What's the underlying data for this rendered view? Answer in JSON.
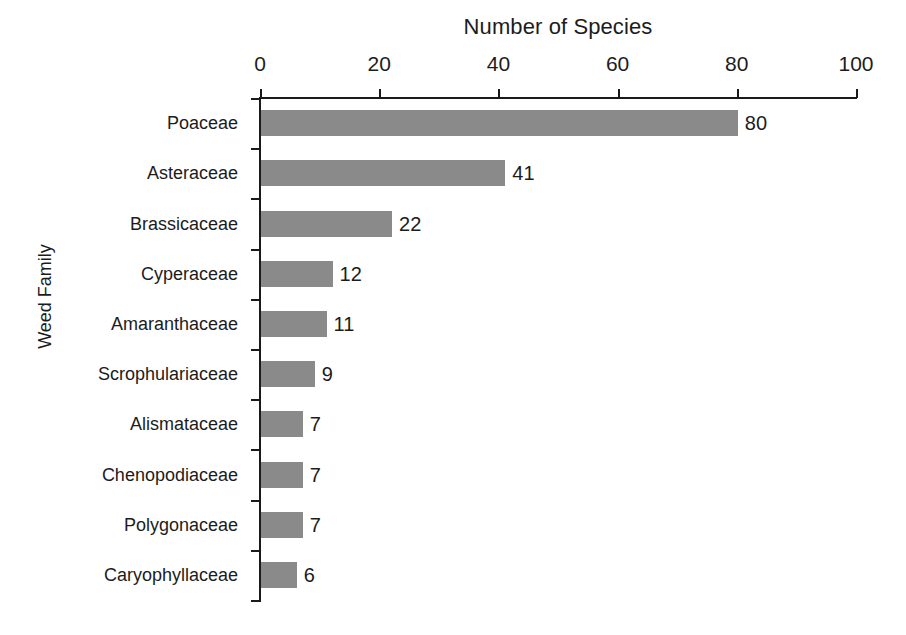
{
  "chart_data": {
    "type": "bar",
    "orientation": "horizontal",
    "title": "Number of Species",
    "xlabel": "Number of Species",
    "ylabel": "Weed Family",
    "xlim": [
      0,
      100
    ],
    "xticks": [
      0,
      20,
      40,
      60,
      80,
      100
    ],
    "grid": false,
    "legend": null,
    "categories": [
      "Poaceae",
      "Asteraceae",
      "Brassicaceae",
      "Cyperaceae",
      "Amaranthaceae",
      "Scrophulariaceae",
      "Alismataceae",
      "Chenopodiaceae",
      "Polygonaceae",
      "Caryophyllaceae"
    ],
    "values": [
      80,
      41,
      22,
      12,
      11,
      9,
      7,
      7,
      7,
      6
    ],
    "data_labels": [
      "80",
      "41",
      "22",
      "12",
      "11",
      "9",
      "7",
      "7",
      "7",
      "6"
    ],
    "bar_color": "#8a8a8a",
    "axis_color": "#1a1a1a",
    "background": "#ffffff"
  }
}
